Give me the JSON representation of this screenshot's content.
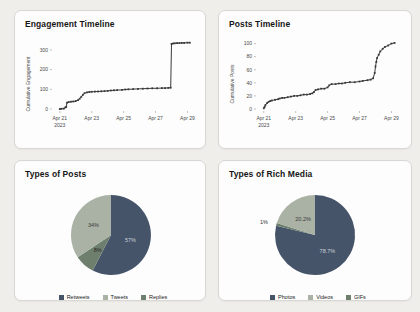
{
  "colors": {
    "page_bg": "#f0eeeb",
    "card_bg": "#fdfdfd",
    "card_border": "#d9d7d4",
    "line_color": "#3a3a3a",
    "pie_dark": "#455469",
    "pie_light": "#a9b2a4",
    "pie_medium": "#6e7f6e"
  },
  "chart_data": [
    {
      "type": "line",
      "title": "Engagement Timeline",
      "ylabel": "Cumulative Engagement",
      "x_unit": "date (April 2023)",
      "xlim": [
        20.7,
        29.6
      ],
      "ylim": [
        0,
        355
      ],
      "yticks": [
        0,
        100,
        200,
        300
      ],
      "xticks": [
        {
          "v": 21,
          "label": "Apr 21",
          "sub": "2023"
        },
        {
          "v": 23,
          "label": "Apr 23"
        },
        {
          "v": 25,
          "label": "Apr 25"
        },
        {
          "v": 27,
          "label": "Apr 27"
        },
        {
          "v": 29,
          "label": "Apr 29"
        }
      ],
      "line_color": "#3a3a3a",
      "points": [
        [
          21.0,
          0
        ],
        [
          21.1,
          1
        ],
        [
          21.25,
          2
        ],
        [
          21.35,
          8
        ],
        [
          21.4,
          10
        ],
        [
          21.45,
          32
        ],
        [
          21.55,
          35
        ],
        [
          21.7,
          37
        ],
        [
          21.85,
          38
        ],
        [
          22.0,
          40
        ],
        [
          22.15,
          45
        ],
        [
          22.25,
          52
        ],
        [
          22.35,
          62
        ],
        [
          22.45,
          72
        ],
        [
          22.55,
          80
        ],
        [
          22.7,
          84
        ],
        [
          22.85,
          86
        ],
        [
          23.0,
          87
        ],
        [
          23.2,
          88
        ],
        [
          23.4,
          89
        ],
        [
          23.6,
          90
        ],
        [
          23.8,
          91
        ],
        [
          24.0,
          92
        ],
        [
          24.2,
          94
        ],
        [
          24.4,
          95
        ],
        [
          24.6,
          96
        ],
        [
          24.9,
          97
        ],
        [
          25.1,
          99
        ],
        [
          25.3,
          100
        ],
        [
          25.6,
          101
        ],
        [
          25.9,
          102
        ],
        [
          26.2,
          103
        ],
        [
          26.5,
          104
        ],
        [
          26.8,
          105
        ],
        [
          27.1,
          105
        ],
        [
          27.4,
          106
        ],
        [
          27.6,
          106
        ],
        [
          27.8,
          107
        ],
        [
          27.95,
          108
        ],
        [
          28.0,
          330
        ],
        [
          28.1,
          332
        ],
        [
          28.2,
          333
        ],
        [
          28.35,
          334
        ],
        [
          28.5,
          334
        ],
        [
          28.65,
          335
        ],
        [
          28.8,
          335
        ],
        [
          29.0,
          336
        ],
        [
          29.15,
          336
        ]
      ]
    },
    {
      "type": "line",
      "title": "Posts Timeline",
      "ylabel": "Cumulative Posts",
      "x_unit": "date (April 2023)",
      "xlim": [
        20.7,
        29.6
      ],
      "ylim": [
        0,
        107
      ],
      "yticks": [
        0,
        20,
        40,
        60,
        80,
        100
      ],
      "xticks": [
        {
          "v": 21,
          "label": "Apr 21",
          "sub": "2023"
        },
        {
          "v": 23,
          "label": "Apr 23"
        },
        {
          "v": 25,
          "label": "Apr 25"
        },
        {
          "v": 27,
          "label": "Apr 27"
        },
        {
          "v": 29,
          "label": "Apr 29"
        }
      ],
      "line_color": "#3a3a3a",
      "points": [
        [
          21.0,
          1
        ],
        [
          21.05,
          3
        ],
        [
          21.1,
          6
        ],
        [
          21.2,
          9
        ],
        [
          21.3,
          11
        ],
        [
          21.4,
          12
        ],
        [
          21.5,
          13
        ],
        [
          21.7,
          14
        ],
        [
          21.9,
          15
        ],
        [
          22.0,
          16
        ],
        [
          22.15,
          17
        ],
        [
          22.3,
          17
        ],
        [
          22.5,
          18
        ],
        [
          22.7,
          19
        ],
        [
          22.9,
          20
        ],
        [
          23.1,
          20
        ],
        [
          23.3,
          21
        ],
        [
          23.5,
          22
        ],
        [
          23.7,
          22
        ],
        [
          23.9,
          23
        ],
        [
          24.05,
          24
        ],
        [
          24.15,
          26
        ],
        [
          24.25,
          29
        ],
        [
          24.4,
          30
        ],
        [
          24.6,
          31
        ],
        [
          24.8,
          31
        ],
        [
          25.0,
          33
        ],
        [
          25.1,
          36
        ],
        [
          25.25,
          38
        ],
        [
          25.5,
          38
        ],
        [
          25.7,
          39
        ],
        [
          25.9,
          39
        ],
        [
          26.1,
          40
        ],
        [
          26.4,
          41
        ],
        [
          26.7,
          41
        ],
        [
          27.0,
          42
        ],
        [
          27.2,
          43
        ],
        [
          27.5,
          44
        ],
        [
          27.7,
          45
        ],
        [
          27.85,
          47
        ],
        [
          27.95,
          55
        ],
        [
          28.0,
          65
        ],
        [
          28.05,
          72
        ],
        [
          28.1,
          78
        ],
        [
          28.2,
          83
        ],
        [
          28.3,
          88
        ],
        [
          28.45,
          92
        ],
        [
          28.6,
          95
        ],
        [
          28.8,
          97
        ],
        [
          29.0,
          100
        ],
        [
          29.2,
          101
        ]
      ]
    },
    {
      "type": "pie",
      "title": "Types of Posts",
      "clockwise_order": [
        0,
        2,
        1
      ],
      "slices": [
        {
          "label": "Retweets",
          "value": 57,
          "display": "57%",
          "color": "#455469",
          "label_color": "#ccd2d9"
        },
        {
          "label": "Tweets",
          "value": 34,
          "display": "34%",
          "color": "#a9b2a4",
          "label_color": "#3c3c3c"
        },
        {
          "label": "Replies",
          "value": 8,
          "display": "8%",
          "color": "#6e7f6e",
          "label_color": "#262626"
        }
      ]
    },
    {
      "type": "pie",
      "title": "Types of Rich Media",
      "clockwise_order": [
        0,
        2,
        1
      ],
      "slices": [
        {
          "label": "Photos",
          "value": 78.7,
          "display": "78.7%",
          "color": "#455469",
          "label_color": "#ccd2d9"
        },
        {
          "label": "Videos",
          "value": 20.2,
          "display": "20.2%",
          "color": "#a9b2a4",
          "label_color": "#3c3c3c"
        },
        {
          "label": "GIFs",
          "value": 1.1,
          "display": "1%",
          "color": "#6e7f6e",
          "label_color": "#333333",
          "outside": true
        }
      ]
    }
  ]
}
